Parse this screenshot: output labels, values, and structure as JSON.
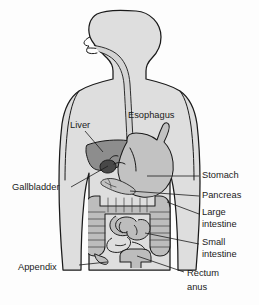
{
  "figure": {
    "type": "anatomical-diagram",
    "view": "anterior body silhouette with head in left profile",
    "background_color": "#fdfdfd"
  },
  "colors": {
    "background": "#fdfdfd",
    "body_fill": "#dedede",
    "body_outline": "#1a1a1a",
    "liver_fill": "#8d8d8d",
    "stomach_fill": "#c2c2c2",
    "gallbladder_fill": "#4a4a4a",
    "intestine_fill": "#bdbdbd",
    "esophagus_fill": "#d2d2d2",
    "label_text": "#1b1b1b",
    "leader_line": "#1c1c1c"
  },
  "labels": [
    {
      "id": "esophagus",
      "text": "Esophagus",
      "lines": [
        "Esophagus"
      ],
      "side": "inside-right",
      "x": 128,
      "y": 116,
      "anchor": "start",
      "has_leader": false
    },
    {
      "id": "liver",
      "text": "Liver",
      "lines": [
        "Liver"
      ],
      "side": "inside-left",
      "x": 70,
      "y": 126,
      "anchor": "start",
      "has_leader": true
    },
    {
      "id": "gallbladder",
      "text": "Gallbladder",
      "lines": [
        "Gallbladder"
      ],
      "side": "left",
      "x": 12,
      "y": 188,
      "anchor": "start",
      "has_leader": true
    },
    {
      "id": "appendix",
      "text": "Appendix",
      "lines": [
        "Appendix"
      ],
      "side": "left",
      "x": 18,
      "y": 268,
      "anchor": "start",
      "has_leader": true
    },
    {
      "id": "stomach",
      "text": "Stomach",
      "lines": [
        "Stomach"
      ],
      "side": "right",
      "x": 202,
      "y": 176,
      "anchor": "start",
      "has_leader": true
    },
    {
      "id": "pancreas",
      "text": "Pancreas",
      "lines": [
        "Pancreas"
      ],
      "side": "right",
      "x": 202,
      "y": 196,
      "anchor": "start",
      "has_leader": true
    },
    {
      "id": "large-intestine",
      "text": "Large intestine",
      "lines": [
        "Large",
        "intestine"
      ],
      "side": "right",
      "x": 202,
      "y": 213,
      "anchor": "start",
      "has_leader": true
    },
    {
      "id": "small-intestine",
      "text": "Small intestine",
      "lines": [
        "Small",
        "intestine"
      ],
      "side": "right",
      "x": 202,
      "y": 243,
      "anchor": "start",
      "has_leader": true
    },
    {
      "id": "rectum-anus",
      "text": "Rectum anus",
      "lines": [
        "Rectum",
        "anus"
      ],
      "side": "right",
      "x": 187,
      "y": 274,
      "anchor": "start",
      "has_leader": true
    }
  ],
  "organs": [
    {
      "id": "esophagus",
      "name": "Esophagus",
      "shade": "light-gray"
    },
    {
      "id": "liver",
      "name": "Liver",
      "shade": "dark-gray"
    },
    {
      "id": "gallbladder",
      "name": "Gallbladder",
      "shade": "very-dark-gray"
    },
    {
      "id": "stomach",
      "name": "Stomach",
      "shade": "medium-gray"
    },
    {
      "id": "pancreas",
      "name": "Pancreas",
      "shade": "medium-gray"
    },
    {
      "id": "large-intestine",
      "name": "Large intestine",
      "shade": "medium-gray"
    },
    {
      "id": "small-intestine",
      "name": "Small intestine",
      "shade": "medium-gray"
    },
    {
      "id": "appendix",
      "name": "Appendix",
      "shade": "medium-gray"
    },
    {
      "id": "rectum",
      "name": "Rectum",
      "shade": "medium-gray"
    }
  ]
}
